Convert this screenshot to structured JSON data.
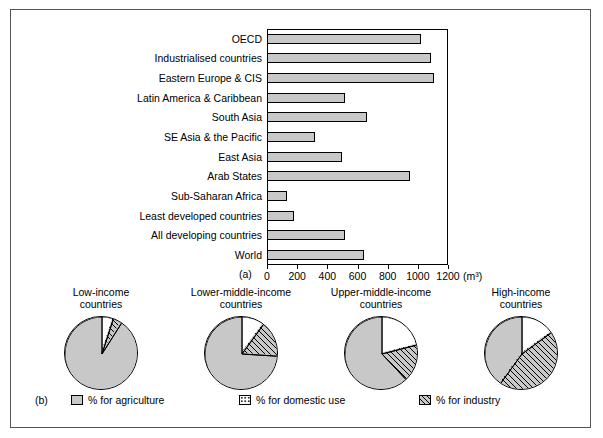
{
  "figure": {
    "panel_a_label": "(a)",
    "panel_b_label": "(b)",
    "x_unit": "(m³)"
  },
  "chart_data": [
    {
      "type": "bar",
      "title": "",
      "orientation": "horizontal",
      "xlabel": "(m³)",
      "ylabel": "",
      "xlim": [
        0,
        1200
      ],
      "xticks": [
        0,
        200,
        400,
        600,
        800,
        1000,
        1200
      ],
      "grid": false,
      "bar_color": "#c8c8c8",
      "categories": [
        "OECD",
        "Industrialised countries",
        "Eastern Europe & CIS",
        "Latin America & Caribbean",
        "South Asia",
        "SE Asia & the Pacific",
        "East Asia",
        "Arab States",
        "Sub-Saharan Africa",
        "Least developed countries",
        "All developing countries",
        "World"
      ],
      "values": [
        1020,
        1090,
        1110,
        520,
        660,
        320,
        500,
        950,
        130,
        180,
        520,
        640
      ]
    },
    {
      "type": "pie",
      "title": "Low-income\ncountries",
      "labels": [
        "% for agriculture",
        "% for domestic use",
        "% for industry"
      ],
      "values": [
        91,
        5,
        4
      ]
    },
    {
      "type": "pie",
      "title": "Lower-middle-income\ncountries",
      "labels": [
        "% for agriculture",
        "% for domestic use",
        "% for industry"
      ],
      "values": [
        74,
        10,
        16
      ]
    },
    {
      "type": "pie",
      "title": "Upper-middle-income\ncountries",
      "labels": [
        "% for agriculture",
        "% for domestic use",
        "% for industry"
      ],
      "values": [
        62,
        21,
        17
      ]
    },
    {
      "type": "pie",
      "title": "High-income\ncountries",
      "labels": [
        "% for agriculture",
        "% for domestic use",
        "% for industry"
      ],
      "values": [
        40,
        15,
        45
      ]
    }
  ],
  "bar_chart": {
    "rows": [
      {
        "label": "OECD",
        "value": 1020
      },
      {
        "label": "Industrialised countries",
        "value": 1090
      },
      {
        "label": "Eastern Europe & CIS",
        "value": 1110
      },
      {
        "label": "Latin America & Caribbean",
        "value": 520
      },
      {
        "label": "South Asia",
        "value": 660
      },
      {
        "label": "SE Asia & the Pacific",
        "value": 320
      },
      {
        "label": "East Asia",
        "value": 500
      },
      {
        "label": "Arab States",
        "value": 950
      },
      {
        "label": "Sub-Saharan Africa",
        "value": 130
      },
      {
        "label": "Least developed countries",
        "value": 180
      },
      {
        "label": "All developing countries",
        "value": 520
      },
      {
        "label": "World",
        "value": 640
      }
    ],
    "xticks": [
      "0",
      "200",
      "400",
      "600",
      "800",
      "1000",
      "1200"
    ]
  },
  "pies": [
    {
      "title": "Low-income\ncountries",
      "agriculture": 91,
      "domestic": 5,
      "industry": 4
    },
    {
      "title": "Lower-middle-income\ncountries",
      "agriculture": 74,
      "domestic": 10,
      "industry": 16
    },
    {
      "title": "Upper-middle-income\ncountries",
      "agriculture": 62,
      "domestic": 21,
      "industry": 17
    },
    {
      "title": "High-income\ncountries",
      "agriculture": 40,
      "domestic": 15,
      "industry": 45
    }
  ],
  "legend": {
    "items": [
      {
        "label": "% for agriculture",
        "pattern": "solid-grey"
      },
      {
        "label": "% for domestic use",
        "pattern": "dotted"
      },
      {
        "label": "% for industry",
        "pattern": "hatched"
      }
    ]
  }
}
